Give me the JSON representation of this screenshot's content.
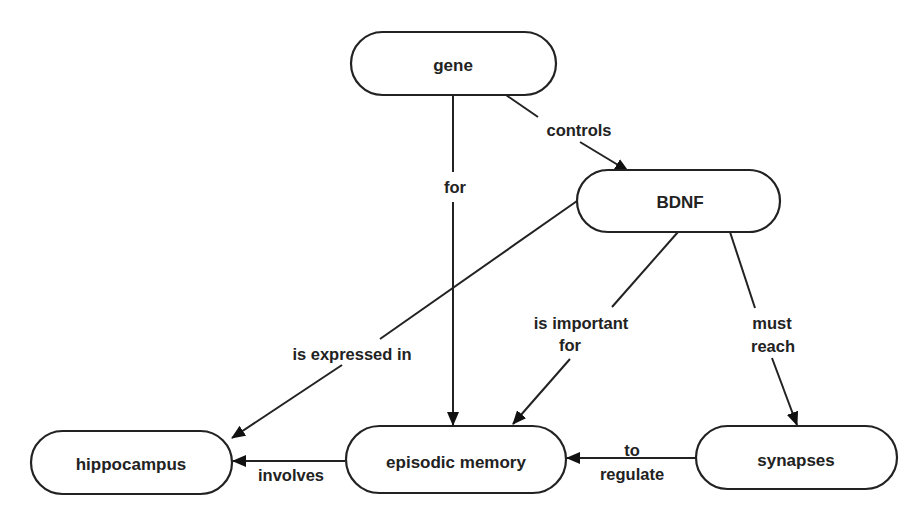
{
  "diagram": {
    "type": "concept-map",
    "nodes": [
      {
        "id": "gene",
        "label": "gene"
      },
      {
        "id": "bdnf",
        "label": "BDNF"
      },
      {
        "id": "hippocampus",
        "label": "hippocampus"
      },
      {
        "id": "episodic",
        "label": "episodic memory"
      },
      {
        "id": "synapses",
        "label": "synapses"
      }
    ],
    "edges": [
      {
        "from": "gene",
        "to": "bdnf",
        "label": [
          "controls"
        ]
      },
      {
        "from": "gene",
        "to": "episodic",
        "label": [
          "for"
        ]
      },
      {
        "from": "bdnf",
        "to": "hippocampus",
        "label": [
          "is expressed in"
        ]
      },
      {
        "from": "bdnf",
        "to": "episodic",
        "label": [
          "is important",
          "for"
        ]
      },
      {
        "from": "bdnf",
        "to": "synapses",
        "label": [
          "must",
          "reach"
        ]
      },
      {
        "from": "episodic",
        "to": "hippocampus",
        "label": [
          "involves"
        ]
      },
      {
        "from": "synapses",
        "to": "episodic",
        "label": [
          "to",
          "regulate"
        ]
      }
    ]
  },
  "colors": {
    "stroke": "#222222",
    "background": "#ffffff"
  }
}
